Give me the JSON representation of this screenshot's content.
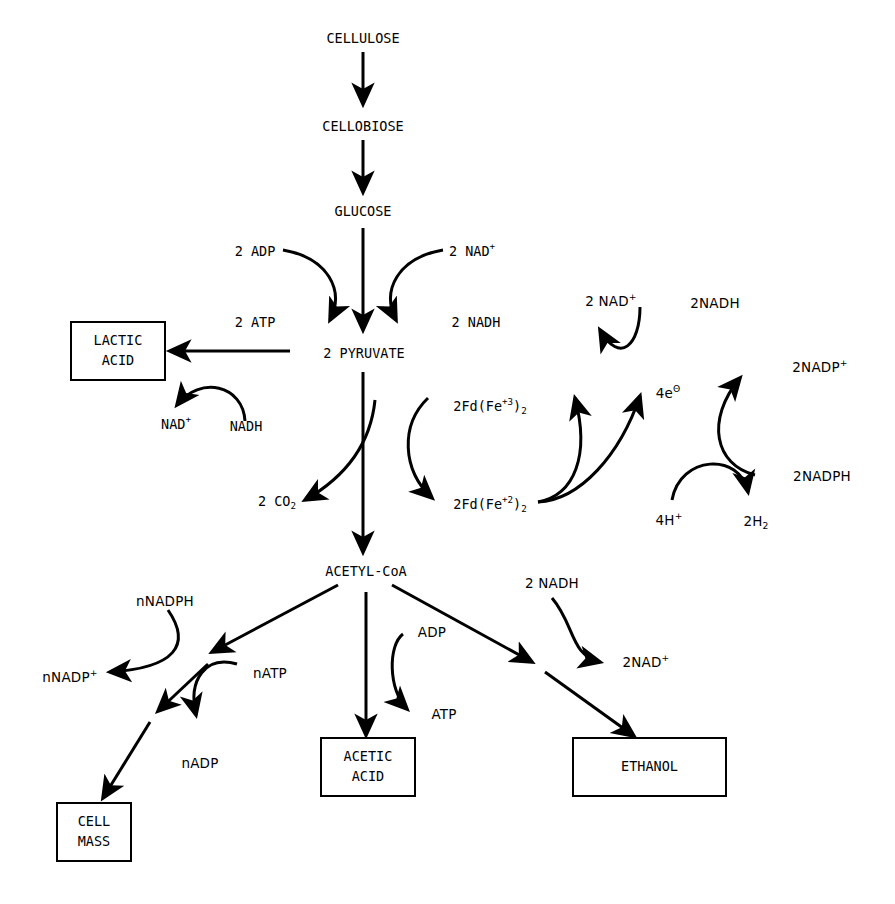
{
  "diagram": {
    "background": "#ffffff",
    "ink": "#000000",
    "nodes": {
      "cellulose": "CELLULOSE",
      "cellobiose": "CELLOBIOSE",
      "glucose": "GLUCOSE",
      "pyruvate": "2  PYRUVATE",
      "acetyl_coa": "ACETYL-CoA",
      "co2": "2  CO",
      "co2_sub": "2"
    },
    "products": {
      "lactic_acid": "LACTIC\nACID",
      "lactic_acid_line1": "LACTIC",
      "lactic_acid_line2": "ACID",
      "acetic_acid_line1": "ACETIC",
      "acetic_acid_line2": "ACID",
      "ethanol": "ETHANOL",
      "cell_mass_line1": "CELL",
      "cell_mass_line2": "MASS"
    },
    "cofactors": {
      "adp_2": "2  ADP",
      "atp_2": "2  ATP",
      "nad_plus_2": "2  NAD",
      "nad_plus_2_sup": "+",
      "nadh_2": "2  NADH",
      "nad_plus_lactate": "NAD",
      "nad_plus_lactate_sup": "+",
      "nadh_lactate": "NADH",
      "fd_fe3": "2Fd(Fe",
      "fd_fe3_sup": "+3",
      "fd_fe3_close": ")",
      "fd_fe3_sub": "2",
      "fd_fe2": "2Fd(Fe",
      "fd_fe2_sup": "+2",
      "fd_fe2_close": ")",
      "fd_fe2_sub": "2",
      "electrons": "4e",
      "electrons_sup": "Θ",
      "nad_plus_top": "2  NAD",
      "nad_plus_top_sup": "+",
      "nadh_top": "2NADH",
      "nadp_plus": "2NADP",
      "nadp_plus_sup": "+",
      "nadph": "2NADPH",
      "protons": "4H",
      "protons_sup": "+",
      "hydrogen": "2H",
      "hydrogen_sub": "2",
      "adp_acetate": "ADP",
      "atp_acetate": "ATP",
      "nadh_ethanol": "2  NADH",
      "nad_plus_ethanol": "2NAD",
      "nad_plus_ethanol_sup": "+",
      "n_nadph": "nNADPH",
      "n_nadp_plus": "nNADP",
      "n_nadp_plus_sup": "+",
      "n_atp": "nATP",
      "n_adp": "nADP"
    }
  }
}
